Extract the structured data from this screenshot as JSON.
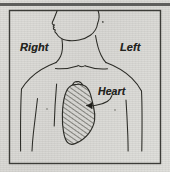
{
  "figure": {
    "frame": {
      "top_rule": "thick horizontal rule",
      "border": "thin rectangular border"
    },
    "labels": {
      "right": "Right",
      "left": "Left",
      "heart": "Heart"
    },
    "icons": {
      "leader_line": "leader-line-with-arrowhead",
      "heart_shading": "diagonal-hatch-fill"
    },
    "colors": {
      "paper": "#d9d9d6",
      "ink": "#2b2b26",
      "rule": "#5e5e5c",
      "hatch": "#3a3a33"
    },
    "parts": [
      "head profile",
      "neck",
      "shoulders",
      "clavicles",
      "sternal notch",
      "chest",
      "upper arms",
      "heart"
    ]
  }
}
